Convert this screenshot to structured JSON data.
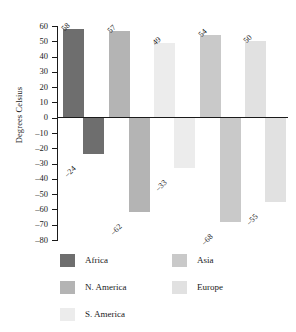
{
  "chart_data": {
    "type": "bar",
    "title": "",
    "subtitle": "",
    "xlabel": "",
    "ylabel": "Degrees Celsius",
    "ylim": [
      -80,
      60
    ],
    "ytick_step": 10,
    "grid": false,
    "legend_position": "bottom",
    "orientation": "vertical",
    "zero_baseline": true,
    "categories": [
      "Africa",
      "N. America",
      "S. America",
      "Asia",
      "Europe"
    ],
    "series": [
      {
        "name": "Positive",
        "values": [
          58,
          57,
          49,
          54,
          50
        ]
      },
      {
        "name": "Negative",
        "values": [
          -24,
          -62,
          -33,
          -68,
          -55
        ]
      }
    ],
    "ytick_labels": [
      "60",
      "50",
      "40",
      "30",
      "20",
      "10",
      "0",
      "–10",
      "–20",
      "–30",
      "–40",
      "–50",
      "–60",
      "–70",
      "–80"
    ],
    "ytick_values": [
      60,
      50,
      40,
      30,
      20,
      10,
      0,
      -10,
      -20,
      -30,
      -40,
      -50,
      -60,
      -70,
      -80
    ],
    "positive_labels": [
      "58",
      "57",
      "49",
      "54",
      "50"
    ],
    "negative_labels": [
      "–24",
      "–62",
      "–33",
      "–68",
      "–55"
    ],
    "colors": {
      "Africa": "#6e6e6e",
      "N. America": "#b4b4b4",
      "S. America": "#ececec",
      "Asia": "#c9c9c9",
      "Europe": "#e1e1e1",
      "axis": "#1a1a1a",
      "background": "#ffffff"
    }
  },
  "legend": {
    "entries": [
      {
        "label": "Africa",
        "color": "#6e6e6e"
      },
      {
        "label": "N. America",
        "color": "#b4b4b4"
      },
      {
        "label": "S. America",
        "color": "#ececec"
      },
      {
        "label": "Asia",
        "color": "#c9c9c9"
      },
      {
        "label": "Europe",
        "color": "#e1e1e1"
      }
    ]
  }
}
